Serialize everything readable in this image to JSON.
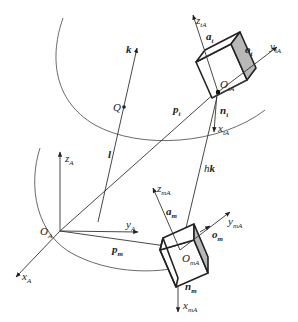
{
  "diagram": {
    "base_frame": {
      "origin": {
        "main": "O",
        "sub": "A"
      },
      "axes": [
        {
          "main": "z",
          "sub": "A"
        },
        {
          "main": "y",
          "sub": "A"
        },
        {
          "main": "x",
          "sub": "A"
        }
      ]
    },
    "tool_frame": {
      "origin": {
        "main": "O",
        "sub": "tA"
      },
      "axes": [
        {
          "main": "z",
          "sub": "tA"
        },
        {
          "main": "y",
          "sub": "tA"
        },
        {
          "main": "x",
          "sub": "tA"
        }
      ],
      "vectors": [
        {
          "main": "a",
          "sub": "t"
        },
        {
          "main": "o",
          "sub": "t"
        },
        {
          "main": "n",
          "sub": "t"
        }
      ]
    },
    "manipulator_frame": {
      "origin": {
        "main": "O",
        "sub": "mA"
      },
      "axes": [
        {
          "main": "z",
          "sub": "mA"
        },
        {
          "main": "y",
          "sub": "mA"
        },
        {
          "main": "x",
          "sub": "mA"
        }
      ],
      "vectors": [
        {
          "main": "a",
          "sub": "m"
        },
        {
          "main": "o",
          "sub": "m"
        },
        {
          "main": "n",
          "sub": "m"
        }
      ]
    },
    "position_vectors": [
      {
        "main": "p",
        "sub": "t"
      },
      {
        "main": "p",
        "sub": "m"
      }
    ],
    "axis_line": {
      "direction": "k",
      "line": "l",
      "point": "Q"
    },
    "offset": {
      "scalar": "h",
      "vector": "k"
    }
  }
}
